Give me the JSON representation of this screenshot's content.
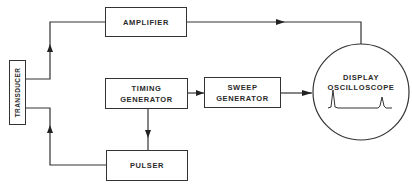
{
  "diagram": {
    "blocks": {
      "transducer": {
        "label": "TRANSDUCER"
      },
      "amplifier": {
        "label": "AMPLIFIER"
      },
      "timing_generator": {
        "line1": "TIMING",
        "line2": "GENERATOR"
      },
      "sweep_generator": {
        "line1": "SWEEP",
        "line2": "GENERATOR"
      },
      "pulser": {
        "label": "PULSER"
      },
      "display": {
        "line1": "DISPLAY",
        "line2": "OSCILLOSCOPE"
      }
    },
    "connections": [
      {
        "from": "transducer",
        "to": "amplifier"
      },
      {
        "from": "amplifier",
        "to": "display"
      },
      {
        "from": "timing_generator",
        "to": "sweep_generator"
      },
      {
        "from": "sweep_generator",
        "to": "display"
      },
      {
        "from": "timing_generator",
        "to": "pulser"
      },
      {
        "from": "pulser",
        "to": "transducer"
      }
    ],
    "colors": {
      "line": "#333333",
      "text": "#2a2a2a",
      "background": "#ffffff"
    }
  }
}
